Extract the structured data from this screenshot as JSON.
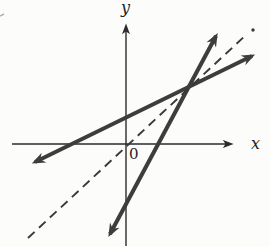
{
  "figure": {
    "bg_color": "#fcfcfa",
    "label_color": "#1f1f1f",
    "labels": {
      "y_axis": "y",
      "x_axis": "x",
      "origin": "0"
    }
  },
  "chart_data": {
    "type": "line",
    "title": "",
    "xlabel": "x",
    "ylabel": "y",
    "origin_label": "0",
    "axes": {
      "ticks": false,
      "grid": false,
      "numeric_labels": false,
      "arrowheads": true
    },
    "series": [
      {
        "name": "solid-line-shallow",
        "style": "solid",
        "thick": true,
        "arrows_both_ends": true,
        "slope_approx": 0.5,
        "y_intercept_sign": "positive",
        "x_intercept_sign": "negative"
      },
      {
        "name": "solid-line-steep",
        "style": "solid",
        "thick": true,
        "arrows_both_ends": true,
        "slope_approx": 1.9,
        "y_intercept_sign": "negative",
        "x_intercept_sign": "positive"
      },
      {
        "name": "dashed-line",
        "style": "dashed",
        "thick": false,
        "slope_approx": 1.0,
        "passes_through": "origin",
        "end_marker": "dot at upper-right tip"
      }
    ],
    "annotations": "Two thick solid lines intersect in quadrant I; the dashed line (slope ~1 through the origin) passes just below their intersection and extends past it to the upper right."
  },
  "geometry": {
    "width": 270,
    "height": 247,
    "axes": [
      {
        "id": "x-axis",
        "x1": 12,
        "y1": 144,
        "x2": 230,
        "y2": 144,
        "w": 1.4,
        "color": "#2b2b2b",
        "me": "arrow-thin"
      },
      {
        "id": "y-axis",
        "x1": 126,
        "y1": 246,
        "x2": 126,
        "y2": 27,
        "w": 1.4,
        "color": "#2b2b2b",
        "me": "arrow-thin"
      }
    ],
    "lines": [
      {
        "id": "solid-line-shallow",
        "x1": 35,
        "y1": 162,
        "x2": 252,
        "y2": 56,
        "w": 4,
        "color": "#3d3d3d",
        "ms": "arrow-thick",
        "me": "arrow-thick"
      },
      {
        "id": "solid-line-steep",
        "x1": 110,
        "y1": 234,
        "x2": 216,
        "y2": 36,
        "w": 4,
        "color": "#3d3d3d",
        "ms": "arrow-thick",
        "me": "arrow-thick"
      },
      {
        "id": "dashed-line",
        "x1": 28,
        "y1": 238,
        "x2": 247,
        "y2": 34,
        "w": 1.9,
        "color": "#383838",
        "dash": "9 6"
      }
    ],
    "dashed_end_dot": {
      "cx": 253,
      "cy": 30,
      "r": 1.7,
      "color": "#383838"
    },
    "stray_mark": {
      "x1": 0,
      "y1": 16,
      "x2": 4,
      "y2": 14,
      "w": 1.5,
      "color": "#b5b0ab"
    }
  }
}
